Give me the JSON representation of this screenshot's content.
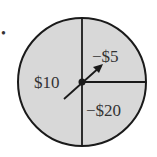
{
  "spinner": {
    "fill_color": "#d8d8d8",
    "stroke_color": "#1a1a1a",
    "bullet": "•",
    "sections": [
      {
        "label": "$10",
        "region": "left half"
      },
      {
        "label": "−$5",
        "region": "upper-right quarter"
      },
      {
        "label": "−$20",
        "region": "lower-right quarter"
      }
    ]
  }
}
